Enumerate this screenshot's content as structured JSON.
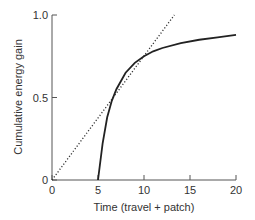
{
  "chart_data": {
    "type": "line",
    "title": "",
    "xlabel": "Time (travel + patch)",
    "ylabel": "Cumulative energy gain",
    "xlim": [
      0,
      20
    ],
    "ylim": [
      0,
      1.0
    ],
    "xticks": [
      "0",
      "5",
      "10",
      "15",
      "20"
    ],
    "yticks": [
      "0",
      "0.5",
      "1.0"
    ],
    "grid": false,
    "legend": null,
    "series": [
      {
        "name": "Cumulative energy gain curve",
        "style": "solid",
        "x": [
          5,
          5.5,
          6,
          6.5,
          7,
          7.5,
          8,
          9,
          10,
          11,
          12,
          14,
          16,
          18,
          20
        ],
        "y": [
          0,
          0.22,
          0.38,
          0.48,
          0.55,
          0.6,
          0.65,
          0.71,
          0.75,
          0.78,
          0.8,
          0.83,
          0.85,
          0.865,
          0.88
        ]
      },
      {
        "name": "Tangent line from origin",
        "style": "dotted",
        "x": [
          0,
          13.3
        ],
        "y": [
          0,
          1.0
        ]
      }
    ]
  }
}
